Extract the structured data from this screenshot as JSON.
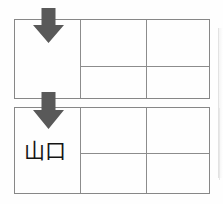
{
  "document": {
    "title": "Form with two grid rows and down arrows",
    "background_color": "#fefefe",
    "border_color": "#878787",
    "grid_line_color": "#8c8c8c",
    "arrow_color": "#595959",
    "text_color": "#151515"
  },
  "arrows": [
    {
      "name": "down-arrow-top",
      "direction": "down",
      "glyph": "⬇",
      "color": "#595959"
    },
    {
      "name": "down-arrow-bottom",
      "direction": "down",
      "glyph": "⬇",
      "color": "#595959"
    }
  ],
  "tables": [
    {
      "id": "table-top",
      "label_cell": "",
      "rows": [
        {
          "cells": [
            "",
            ""
          ]
        },
        {
          "cells": [
            "",
            ""
          ]
        }
      ]
    },
    {
      "id": "table-bottom",
      "label_cell": "山口",
      "rows": [
        {
          "cells": [
            "",
            ""
          ]
        },
        {
          "cells": [
            "",
            ""
          ]
        }
      ]
    }
  ]
}
